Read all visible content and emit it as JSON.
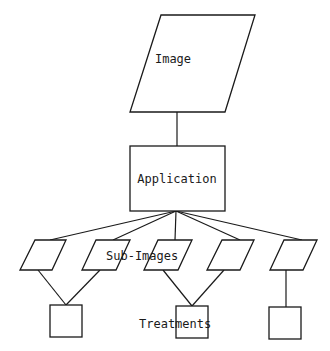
{
  "diagram": {
    "nodes": {
      "image": {
        "label": "Image",
        "shape": "parallelogram"
      },
      "application": {
        "label": "Application",
        "shape": "rectangle"
      },
      "sub_images": {
        "label": "Sub-Images",
        "count": 5,
        "shape": "parallelogram"
      },
      "treatments": {
        "label": "Treatments",
        "count": 3,
        "shape": "square"
      }
    },
    "edges": [
      [
        "image",
        "application"
      ],
      [
        "application",
        "sub_image_1"
      ],
      [
        "application",
        "sub_image_2"
      ],
      [
        "application",
        "sub_image_3"
      ],
      [
        "application",
        "sub_image_4"
      ],
      [
        "application",
        "sub_image_5"
      ],
      [
        "sub_image_1",
        "treatment_1"
      ],
      [
        "sub_image_2",
        "treatment_1"
      ],
      [
        "sub_image_3",
        "treatment_2"
      ],
      [
        "sub_image_4",
        "treatment_2"
      ],
      [
        "sub_image_5",
        "treatment_3"
      ]
    ]
  }
}
